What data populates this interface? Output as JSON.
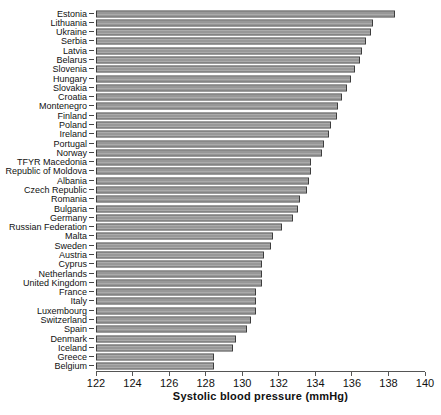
{
  "figure": {
    "background": "#ffffff"
  },
  "chart_data": {
    "type": "bar",
    "orientation": "horizontal",
    "title": "",
    "xlabel": "Systolic blood pressure (mmHg)",
    "ylabel": "",
    "xlim": [
      122,
      140
    ],
    "xticks": [
      122,
      124,
      126,
      128,
      130,
      132,
      134,
      136,
      138,
      140
    ],
    "grid": false,
    "legend": false,
    "sorted": "descending",
    "categories": [
      "Estonia",
      "Lithuania",
      "Ukraine",
      "Serbia",
      "Latvia",
      "Belarus",
      "Slovenia",
      "Hungary",
      "Slovakia",
      "Croatia",
      "Montenegro",
      "Finland",
      "Poland",
      "Ireland",
      "Portugal",
      "Norway",
      "TFYR Macedonia",
      "Republic of Moldova",
      "Albania",
      "Czech Republic",
      "Romania",
      "Bulgaria",
      "Germany",
      "Russian Federation",
      "Malta",
      "Sweden",
      "Austria",
      "Cyprus",
      "Netherlands",
      "United Kingdom",
      "France",
      "Italy",
      "Luxembourg",
      "Switzerland",
      "Spain",
      "Denmark",
      "Iceland",
      "Greece",
      "Belgium"
    ],
    "values": [
      138.4,
      137.2,
      137.1,
      136.8,
      136.6,
      136.5,
      136.2,
      136.0,
      135.8,
      135.5,
      135.3,
      135.2,
      134.9,
      134.8,
      134.5,
      134.4,
      133.8,
      133.8,
      133.7,
      133.6,
      133.2,
      133.1,
      132.8,
      132.2,
      131.7,
      131.6,
      131.2,
      131.1,
      131.1,
      131.1,
      130.8,
      130.8,
      130.8,
      130.5,
      130.3,
      129.7,
      129.5,
      128.5,
      128.5
    ],
    "bar_fill": "#989898",
    "bar_fill_stripe": "#ababab",
    "bar_border": "#3d3d3d",
    "axis_color": "#555555",
    "text_color": "#111111"
  }
}
